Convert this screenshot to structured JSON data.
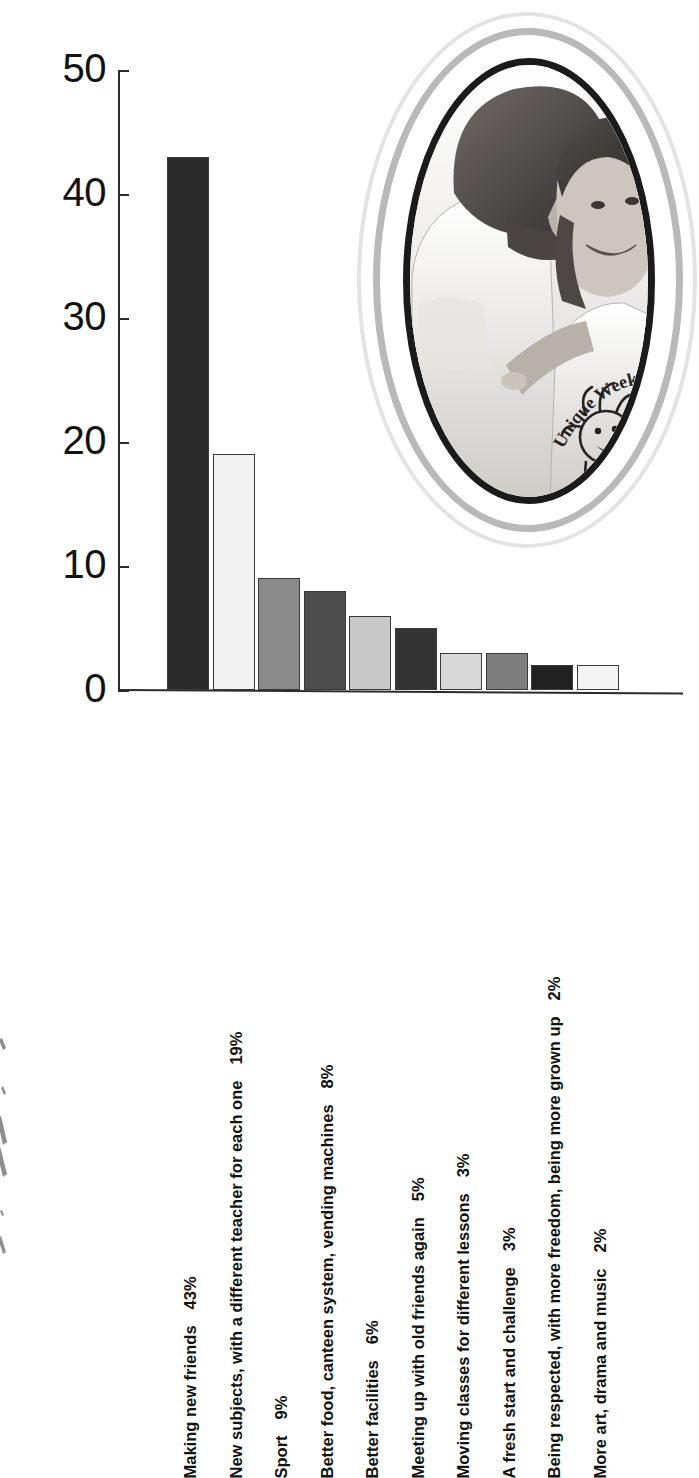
{
  "chart_data": {
    "type": "bar",
    "title": "",
    "subtitle": "",
    "xlabel": "",
    "ylabel": "",
    "ylim": [
      0,
      50
    ],
    "yticks": [
      0,
      10,
      20,
      30,
      40,
      50
    ],
    "grid": false,
    "legend": "none",
    "orientation": "vertical",
    "value_unit": "%",
    "categories": [
      "Making new friends",
      "New subjects, with a different teacher for each one",
      "Sport",
      "Better food, canteen system, vending machines",
      "Better facilities",
      "Meeting up with old friends again",
      "Moving classes for different lessons",
      "A fresh start and challenge",
      "Being respected, with more freedom, being more grown up",
      "More art, drama and music"
    ],
    "values": [
      43,
      19,
      9,
      8,
      6,
      5,
      3,
      3,
      2,
      2
    ],
    "value_labels": [
      "43%",
      "19%",
      "9%",
      "8%",
      "6%",
      "5%",
      "3%",
      "3%",
      "2%",
      "2%"
    ],
    "bar_colors": [
      "#2b2b2b",
      "#f2f2f2",
      "#8a8a8a",
      "#4d4d4d",
      "#c8c8c8",
      "#333333",
      "#d8d8d8",
      "#7d7d7d",
      "#222222",
      "#f4f4f4"
    ],
    "bar_outline_color": "#3a3a3a",
    "axis_color": "#2b2b2b",
    "background_color": "#ffffff"
  },
  "photo": {
    "name": "students-photo",
    "description": "Black and white photograph of two young students, one leaning in beside the other, both smiling",
    "tshirt_text": "Unique Week 9",
    "frame_style": "circular",
    "ring_colors": [
      "#e3e3e3",
      "#b9b9b9",
      "#ffffff",
      "#1b1b1b"
    ]
  }
}
